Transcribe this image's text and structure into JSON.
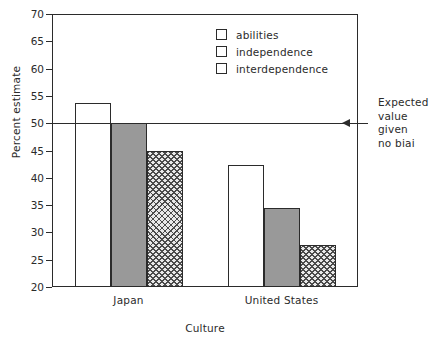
{
  "chart_data": {
    "type": "bar",
    "title": "",
    "xlabel": "Culture",
    "ylabel": "Percent estimate",
    "ylim": [
      20,
      70
    ],
    "ytick_step": 5,
    "yticks": [
      70,
      65,
      60,
      55,
      50,
      45,
      40,
      35,
      30,
      25,
      20
    ],
    "grid": false,
    "legend_position": "top-center-right",
    "categories": [
      "Japan",
      "United States"
    ],
    "series": [
      {
        "name": "abilities",
        "fill": "none",
        "values": [
          53.7,
          42.3
        ]
      },
      {
        "name": "independence",
        "fill": "gray",
        "values": [
          50.0,
          34.4
        ]
      },
      {
        "name": "interdependence",
        "fill": "hatch",
        "values": [
          45.0,
          27.7
        ]
      }
    ],
    "reference_line": {
      "value": 50,
      "label_lines": [
        "Expected",
        "value",
        "given",
        "no biai"
      ]
    },
    "colors": {
      "axis": "#2b2b2b",
      "bar_outline": "#2b2b2b",
      "fill_none": "#ffffff",
      "fill_gray": "#999999",
      "fill_hatch": "#e8e8e8",
      "background": "#ffffff"
    }
  },
  "legend": {
    "items": [
      {
        "label": "abilities",
        "swatch": "swatch-empty"
      },
      {
        "label": "independence",
        "swatch": "swatch-gray"
      },
      {
        "label": "interdependence",
        "swatch": "swatch-hatched"
      }
    ]
  },
  "annotation": {
    "line1": "Expected",
    "line2": "value",
    "line3": "given",
    "line4": "no biai"
  },
  "axes": {
    "y_title": "Percent estimate",
    "x_title": "Culture",
    "y_labels": [
      "70",
      "65",
      "60",
      "55",
      "50",
      "45",
      "40",
      "35",
      "30",
      "25",
      "20"
    ],
    "x_labels": [
      "Japan",
      "United States"
    ]
  }
}
